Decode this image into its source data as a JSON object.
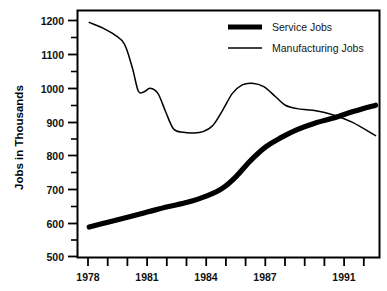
{
  "chart_data": {
    "type": "line",
    "title": "",
    "xlabel": "",
    "ylabel": "Jobs in Thousands",
    "xlim": [
      1977.4,
      1992.8
    ],
    "ylim": [
      500,
      1230
    ],
    "grid": false,
    "legend_position": "top-right",
    "y_ticks_major": [
      500,
      600,
      700,
      800,
      900,
      1000,
      1100,
      1200
    ],
    "y_ticks_minor": [
      550,
      650,
      750,
      850,
      950,
      1050,
      1150
    ],
    "x_ticks_labeled": [
      1978,
      1981,
      1984,
      1987,
      1991
    ],
    "x_ticks_all": [
      1978,
      1979,
      1980,
      1981,
      1982,
      1983,
      1984,
      1985,
      1986,
      1987,
      1988,
      1989,
      1990,
      1991,
      1992
    ],
    "series": [
      {
        "name": "Service Jobs",
        "line_style": "thick",
        "color": "#000000",
        "x": [
          1978.0,
          1979.0,
          1980.0,
          1981.0,
          1982.0,
          1983.0,
          1984.0,
          1984.8,
          1985.5,
          1986.2,
          1987.0,
          1987.8,
          1988.6,
          1989.5,
          1990.5,
          1991.5,
          1992.6
        ],
        "values": [
          590,
          605,
          620,
          635,
          650,
          663,
          682,
          705,
          740,
          785,
          827,
          855,
          878,
          897,
          913,
          932,
          950
        ]
      },
      {
        "name": "Manufacturing Jobs",
        "line_style": "thin",
        "color": "#000000",
        "x": [
          1978.0,
          1978.7,
          1979.3,
          1979.8,
          1980.2,
          1980.5,
          1980.8,
          1981.1,
          1981.5,
          1981.9,
          1982.3,
          1982.8,
          1983.3,
          1983.8,
          1984.3,
          1984.8,
          1985.3,
          1985.8,
          1986.3,
          1986.9,
          1987.5,
          1988.0,
          1988.6,
          1989.4,
          1990.4,
          1991.4,
          1992.6
        ],
        "values": [
          1195,
          1178,
          1158,
          1130,
          1060,
          992,
          990,
          1000,
          985,
          930,
          880,
          870,
          868,
          872,
          890,
          935,
          985,
          1010,
          1015,
          1005,
          975,
          950,
          940,
          935,
          922,
          900,
          860
        ]
      }
    ]
  },
  "axes": {
    "y_axis_title": "Jobs in Thousands",
    "y_tick_labels": [
      "1200",
      "1100",
      "1000",
      "900",
      "800",
      "700",
      "600",
      "500"
    ],
    "x_tick_labels": [
      "1978",
      "1981",
      "1984",
      "1987",
      "1991"
    ]
  },
  "legend": {
    "items": [
      {
        "label": "Service Jobs",
        "swatch": "thick-line-swatch"
      },
      {
        "label": "Manufacturing Jobs",
        "swatch": "thin-line-swatch"
      }
    ]
  }
}
